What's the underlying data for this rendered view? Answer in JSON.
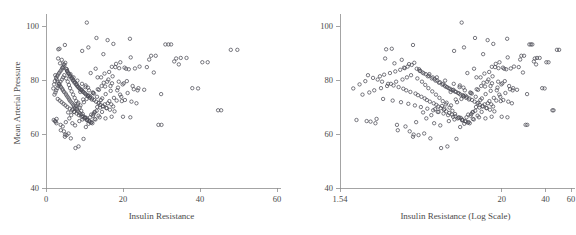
{
  "figure": {
    "background_color": "#ffffff",
    "marker_color": "#4c4c55",
    "axis_color": "#8d8d8d",
    "text_color": "#4a4a4a",
    "panel_count": 2
  },
  "chart_data": [
    {
      "type": "scatter",
      "panel": "left",
      "title": "",
      "xlabel": "Insulin Resistance",
      "ylabel": "Mean Arterial Pressure",
      "xscale": "linear",
      "yscale": "linear",
      "xlim": [
        0,
        60
      ],
      "ylim": [
        40,
        103
      ],
      "xticks": [
        0,
        20,
        40,
        60
      ],
      "xticklabels": [
        "0",
        "20",
        "40",
        "60"
      ],
      "yticks": [
        40,
        60,
        80,
        100
      ],
      "yticklabels": [
        "40",
        "60",
        "80",
        "100"
      ],
      "grid": false,
      "legend": false,
      "marker": "open-circle",
      "n_points": 286,
      "x": [
        10.6,
        4.9,
        3.2,
        11.0,
        13.1,
        9.4,
        16.0,
        17.5,
        21.8,
        14.9,
        22.0,
        31.8,
        49.7,
        40.6,
        27.3,
        29.9,
        44.7,
        39.5,
        35.0,
        33.3,
        26.8,
        24.3,
        23.1,
        20.4,
        19.3,
        18.2,
        17.1,
        16.4,
        15.2,
        14.3,
        3.5,
        4.1,
        4.6,
        5.0,
        5.4,
        5.8,
        6.2,
        6.6,
        7.0,
        7.4,
        7.8,
        8.2,
        8.6,
        9.0,
        9.5,
        10.0,
        10.4,
        10.9,
        11.4,
        11.9,
        2.4,
        2.8,
        3.0,
        3.3,
        3.6,
        3.9,
        4.2,
        4.4,
        4.7,
        5.1,
        5.3,
        5.6,
        5.9,
        6.1,
        6.4,
        6.8,
        7.1,
        7.3,
        7.6,
        8.0,
        8.3,
        8.7,
        9.1,
        9.6,
        10.1,
        10.7,
        11.2,
        11.7,
        12.2,
        12.7,
        13.3,
        13.8,
        14.6,
        15.5,
        16.8,
        18.7,
        19.9,
        21.0,
        22.5,
        23.8,
        1.9,
        2.1,
        2.3,
        2.6,
        2.9,
        3.1,
        3.4,
        3.7,
        4.0,
        4.3,
        4.5,
        4.8,
        5.2,
        5.5,
        5.7,
        6.0,
        6.3,
        6.7,
        6.9,
        7.2,
        7.5,
        7.9,
        8.1,
        8.4,
        8.8,
        9.2,
        9.7,
        10.2,
        10.8,
        11.5,
        12.0,
        12.5,
        13.0,
        13.6,
        14.1,
        14.8,
        15.8,
        16.6,
        17.8,
        20.0,
        2.0,
        2.5,
        2.7,
        3.8,
        4.35,
        5.15,
        6.05,
        6.55,
        7.25,
        8.05,
        8.95,
        9.85,
        10.55,
        11.25,
        12.15,
        13.45,
        14.45,
        15.0,
        16.2,
        17.3,
        18.0,
        19.0,
        20.8,
        21.5,
        24.0,
        25.5,
        28.0,
        30.0,
        32.5,
        34.5,
        3.05,
        3.55,
        4.05,
        4.55,
        5.05,
        5.55,
        6.15,
        6.75,
        7.35,
        7.95,
        8.55,
        9.25,
        9.95,
        10.65,
        11.35,
        12.05,
        12.85,
        13.65,
        14.55,
        15.65,
        16.95,
        18.35,
        19.55,
        21.2,
        22.8,
        2.2,
        2.45,
        2.65,
        2.95,
        3.25,
        3.45,
        3.75,
        4.15,
        4.45,
        4.75,
        5.25,
        5.65,
        5.95,
        6.25,
        6.65,
        7.05,
        7.45,
        7.85,
        8.25,
        8.75,
        9.15,
        9.55,
        10.15,
        10.75,
        11.45,
        12.35,
        13.15,
        14.05,
        15.25,
        16.45,
        17.65,
        19.25,
        20.5,
        22.2,
        23.5,
        4.9,
        5.35,
        6.45,
        7.65,
        8.45,
        9.75,
        10.35,
        11.05,
        11.85,
        12.65,
        13.95,
        15.45,
        17.05,
        18.9,
        20.2,
        3.15,
        3.65,
        4.25,
        5.45,
        6.35,
        7.15,
        8.15,
        9.35,
        10.25,
        11.15,
        12.45,
        13.25,
        14.25,
        16.05,
        17.45,
        10.3,
        10.9,
        9.3,
        8.9,
        12.9,
        11.6,
        13.4,
        15.9,
        16.75,
        18.5,
        4.65,
        5.85,
        6.85,
        7.55,
        8.65,
        9.45,
        10.45,
        11.75,
        12.55,
        14.75,
        2.35,
        2.75,
        3.85,
        4.95,
        5.75,
        6.95,
        7.75,
        8.35,
        9.65,
        10.95,
        12.25,
        13.75,
        15.35,
        17.15,
        19.7,
        21.9,
        26.2,
        29.2,
        33.8,
        38.0,
        42.0,
        45.5,
        48.0,
        36.5,
        31.0,
        28.5
      ],
      "y": [
        101.3,
        93.0,
        91.4,
        92.1,
        95.6,
        90.8,
        94.8,
        93.4,
        95.3,
        89.6,
        88.4,
        93.2,
        91.2,
        86.6,
        89.0,
        74.8,
        68.8,
        76.9,
        88.2,
        86.9,
        87.6,
        85.0,
        84.3,
        84.6,
        86.6,
        86.0,
        84.9,
        83.0,
        82.4,
        81.0,
        91.6,
        87.5,
        85.9,
        86.4,
        84.0,
        82.5,
        81.4,
        80.6,
        79.8,
        79.0,
        78.3,
        77.6,
        77.0,
        76.4,
        75.8,
        75.2,
        74.6,
        74.0,
        73.4,
        72.8,
        81.8,
        80.2,
        79.4,
        78.6,
        78.0,
        77.4,
        76.8,
        76.2,
        75.6,
        75.0,
        74.4,
        73.8,
        73.2,
        72.6,
        72.0,
        71.4,
        70.8,
        70.2,
        69.6,
        69.0,
        68.4,
        67.8,
        67.2,
        66.6,
        66.0,
        65.4,
        64.8,
        64.2,
        66.8,
        68.2,
        70.0,
        71.6,
        73.2,
        74.8,
        76.0,
        77.2,
        78.4,
        79.6,
        77.8,
        76.2,
        76.9,
        78.4,
        79.6,
        80.8,
        81.4,
        82.0,
        82.6,
        83.2,
        83.8,
        84.4,
        85.0,
        85.6,
        84.2,
        83.4,
        82.8,
        82.2,
        81.6,
        81.0,
        80.4,
        79.8,
        79.2,
        78.6,
        78.0,
        77.4,
        76.8,
        76.2,
        75.6,
        75.0,
        74.4,
        73.8,
        73.2,
        72.6,
        72.0,
        71.4,
        70.8,
        70.2,
        69.6,
        69.0,
        68.4,
        66.4,
        65.2,
        64.6,
        64.0,
        63.4,
        62.8,
        64.4,
        65.8,
        67.0,
        68.2,
        69.4,
        70.6,
        71.8,
        73.0,
        74.2,
        75.4,
        76.6,
        77.8,
        79.0,
        80.2,
        81.4,
        84.8,
        84.4,
        84.2,
        84.0,
        77.0,
        76.4,
        82.8,
        63.4,
        93.2,
        85.8,
        73.0,
        72.4,
        71.8,
        71.2,
        70.6,
        70.0,
        69.4,
        68.8,
        68.2,
        67.6,
        67.0,
        66.4,
        65.8,
        65.2,
        64.6,
        64.0,
        65.4,
        66.8,
        68.2,
        69.6,
        71.0,
        72.4,
        73.8,
        75.2,
        76.6,
        74.6,
        75.4,
        76.2,
        77.0,
        77.8,
        78.6,
        79.4,
        80.2,
        81.0,
        81.8,
        80.6,
        79.4,
        78.2,
        77.0,
        75.8,
        74.6,
        73.4,
        72.2,
        71.0,
        69.8,
        68.6,
        67.4,
        66.2,
        65.0,
        66.2,
        67.4,
        68.6,
        69.8,
        71.0,
        72.2,
        73.4,
        74.6,
        72.6,
        72.0,
        71.4,
        59.0,
        59.6,
        58.4,
        54.8,
        55.4,
        58.2,
        62.6,
        63.8,
        64.4,
        65.6,
        66.2,
        65.8,
        66.4,
        79.4,
        78.8,
        88.0,
        86.2,
        84.6,
        83.4,
        82.2,
        81.0,
        79.8,
        78.6,
        77.4,
        76.2,
        75.0,
        73.8,
        72.6,
        71.4,
        70.2,
        78.0,
        77.2,
        76.4,
        75.6,
        84.2,
        82.6,
        81.0,
        79.4,
        77.8,
        76.2,
        61.0,
        60.2,
        64.0,
        63.2,
        64.8,
        65.4,
        66.0,
        67.2,
        68.0,
        70.4,
        64.8,
        65.6,
        61.4,
        59.8,
        68.0,
        69.2,
        70.4,
        71.6,
        72.8,
        74.0,
        75.2,
        76.4,
        77.6,
        78.8,
        72.2,
        66.2,
        84.8,
        63.4,
        88.0,
        77.0,
        86.6,
        68.8,
        91.2,
        88.2,
        93.2,
        89.0
      ]
    },
    {
      "type": "scatter",
      "panel": "right",
      "title": "",
      "xlabel": "Insulin Resistance (Log Scale)",
      "ylabel": "",
      "xscale": "log",
      "yscale": "linear",
      "xlim": [
        1.54,
        60
      ],
      "ylim": [
        40,
        103
      ],
      "xticks": [
        1.54,
        20,
        40,
        60
      ],
      "xticklabels": [
        "1.54",
        "20",
        "40",
        "60"
      ],
      "yticks": [
        40,
        60,
        80,
        100
      ],
      "yticklabels": [
        "40",
        "60",
        "80",
        "100"
      ],
      "grid": false,
      "legend": false,
      "marker": "open-circle",
      "n_points": 286,
      "note": "Same y values as left panel; x values identical but drawn on a logarithmic horizontal axis spanning 1.54 to 60."
    }
  ],
  "labels": {
    "y_axis_title_left": "Mean Arterial Pressure",
    "x_axis_title_left": "Insulin Resistance",
    "x_axis_title_right": "Insulin Resistance (Log Scale)"
  }
}
